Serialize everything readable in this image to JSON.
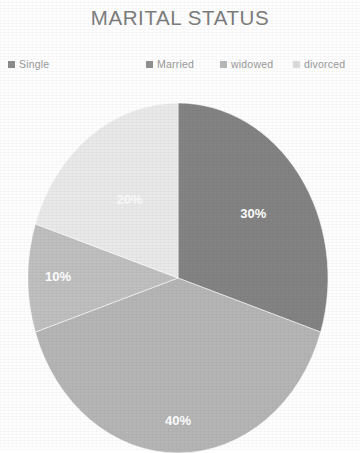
{
  "chart_data": {
    "type": "pie",
    "title": "MARITAL STATUS",
    "xlabel": "",
    "ylabel": "",
    "grid": false,
    "legend_position": "top",
    "value_label_suffix": "%",
    "categories": [
      "Single",
      "Married",
      "widowed",
      "divorced"
    ],
    "values": [
      30,
      40,
      10,
      20
    ],
    "slices": [
      {
        "label": "Single",
        "value": 30,
        "value_label": "30%",
        "color": "#838383",
        "start_angle_deg": 0,
        "end_angle_deg": 108
      },
      {
        "label": "Married",
        "value": 40,
        "value_label": "40%",
        "color": "#b5b5b5",
        "start_angle_deg": 108,
        "end_angle_deg": 252
      },
      {
        "label": "widowed",
        "value": 10,
        "value_label": "10%",
        "color": "#bfbfbf",
        "start_angle_deg": 252,
        "end_angle_deg": 288
      },
      {
        "label": "divorced",
        "value": 20,
        "value_label": "20%",
        "color": "#e9e9e9",
        "start_angle_deg": 288,
        "end_angle_deg": 360
      }
    ],
    "legend": [
      {
        "label": "Single",
        "color": "#8c8c8c",
        "swatch_icon": "square-swatch-icon"
      },
      {
        "label": "Married",
        "color": "#909090",
        "swatch_icon": "square-swatch-icon"
      },
      {
        "label": "widowed",
        "color": "#b9b9b9",
        "swatch_icon": "square-swatch-icon"
      },
      {
        "label": "divorced",
        "color": "#dcdcdc",
        "swatch_icon": "square-swatch-icon"
      }
    ],
    "title_color": "#7d7d7d",
    "legend_text_color": "#9a9a9a",
    "label_text_color": "#ffffff",
    "background_color": "#fefefe"
  }
}
